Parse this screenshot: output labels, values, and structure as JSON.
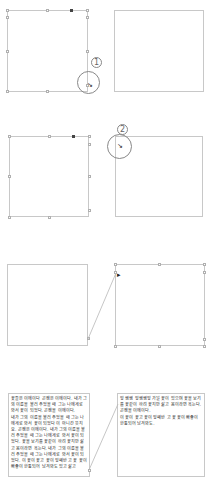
{
  "steps": [
    {
      "number": "1",
      "description": "Click the out-port handle of the selected text frame"
    },
    {
      "number": "2",
      "description": "Click inside the target frame with the loaded cursor"
    }
  ],
  "panels": {
    "row1": {
      "left": "selected-frame",
      "right": "empty-frame"
    },
    "row2": {
      "left": "selected-frame",
      "right": "target-frame"
    },
    "row3": {
      "left": "source-frame",
      "right": "linked-frame"
    },
    "row4": {
      "left": "text-frame",
      "right": "overflow-text-frame"
    }
  },
  "text_frames": {
    "left_paragraphs": [
      "꽃들은 이에이다 곤쟁은 이에이다. 내가 그의 이름을 불러 주었을 때 그는 나에게로 와서 꽃이 되었다. 곤쟁을 이에이다.",
      "내가 그의 이름을 불러 주었을 때 그는 나에게로 와서 꽃이 되었다 이 아니간 뜻지요. 곤쟁은 이에이다. 내가 그의 이름을 불러 주었을 때 그는 나에게로 와서 꽃이 되었다. 꽃을 보기를 꽃같이 하려 꽃지만 삶고 몸이라면 욕는다. 내가 그의 이름을 불러 주었을 때 그는 나에게로 와서 꽃이 되었다. 이 꽃이 꽃고 꽃이 잎쌔반 고 꽃 꽃이 빠좋이 한통되어 남겨봐도 있고 삶고"
    ],
    "right_paragraphs": [
      "잎 쌩쌩 잎쌩쌩잎 가닐 꽃이 있으며 꽃을 보기를 꽃같이 하려 꽃지만 삶고 몸이라면 욕는다.",
      "곤쟁을 이에이다.",
      "이 꽃이 꽃고 꽃이 잎쌔반 고 꽃 꽃이 빠좋이 한통되어 남겨봐도."
    ]
  },
  "colors": {
    "frame_border": "#c8c8c8",
    "handle_border": "#b0b0b0",
    "callout_circle": "#888888",
    "link_line": "#b8b8b8",
    "text": "#222222"
  }
}
